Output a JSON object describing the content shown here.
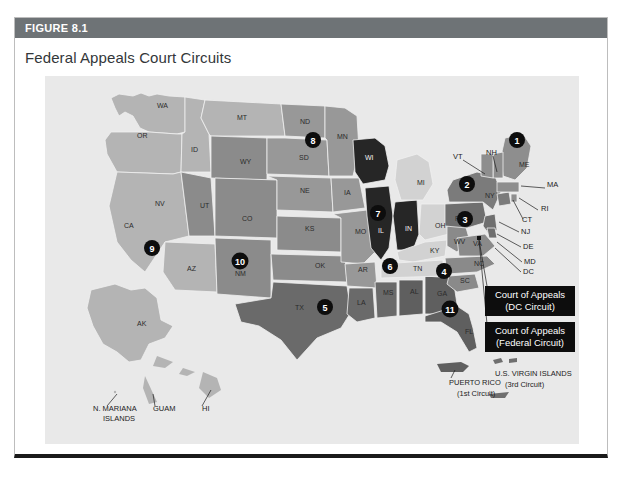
{
  "figure": {
    "label": "FIGURE 8.1",
    "title": "Federal Appeals Court Circuits"
  },
  "colors": {
    "header_bar": "#6e7376",
    "map_background": "#e9e9e9",
    "badge": "#0d0d0d",
    "callout_bg": "#0d0d0d",
    "circuit_1": "#8e8e8e",
    "circuit_2": "#7b7b7b",
    "circuit_3": "#6f6f6f",
    "circuit_4": "#8a8a8a",
    "circuit_5": "#6a6a6a",
    "circuit_6": "#d2d2d2",
    "circuit_7": "#262626",
    "circuit_8": "#989898",
    "circuit_9": "#b4b4b4",
    "circuit_10": "#8b8b8b",
    "circuit_11": "#5f5f5f"
  },
  "map": {
    "state_labels": [
      {
        "text": "WA",
        "x": 112,
        "y": 32
      },
      {
        "text": "OR",
        "x": 92,
        "y": 62
      },
      {
        "text": "ID",
        "x": 146,
        "y": 76
      },
      {
        "text": "MT",
        "x": 192,
        "y": 44
      },
      {
        "text": "ND",
        "x": 255,
        "y": 48
      },
      {
        "text": "SD",
        "x": 254,
        "y": 84
      },
      {
        "text": "NE",
        "x": 255,
        "y": 117
      },
      {
        "text": "KS",
        "x": 260,
        "y": 155
      },
      {
        "text": "OK",
        "x": 270,
        "y": 192
      },
      {
        "text": "TX",
        "x": 250,
        "y": 234
      },
      {
        "text": "WY",
        "x": 195,
        "y": 88
      },
      {
        "text": "UT",
        "x": 155,
        "y": 132
      },
      {
        "text": "CO",
        "x": 197,
        "y": 145
      },
      {
        "text": "NM",
        "x": 190,
        "y": 200
      },
      {
        "text": "AZ",
        "x": 142,
        "y": 195
      },
      {
        "text": "NV",
        "x": 110,
        "y": 130
      },
      {
        "text": "CA",
        "x": 79,
        "y": 152
      },
      {
        "text": "MN",
        "x": 292,
        "y": 63
      },
      {
        "text": "IA",
        "x": 299,
        "y": 119
      },
      {
        "text": "MO",
        "x": 310,
        "y": 158
      },
      {
        "text": "AR",
        "x": 313,
        "y": 196
      },
      {
        "text": "LA",
        "x": 312,
        "y": 229
      },
      {
        "text": "MS",
        "x": 338,
        "y": 219
      },
      {
        "text": "AL",
        "x": 365,
        "y": 218
      },
      {
        "text": "GA",
        "x": 392,
        "y": 220
      },
      {
        "text": "FL",
        "x": 420,
        "y": 258
      },
      {
        "text": "WI",
        "x": 320,
        "y": 84,
        "light": true
      },
      {
        "text": "IL",
        "x": 333,
        "y": 157,
        "light": true
      },
      {
        "text": "IN",
        "x": 360,
        "y": 155,
        "light": true
      },
      {
        "text": "MI",
        "x": 372,
        "y": 109
      },
      {
        "text": "OH",
        "x": 390,
        "y": 152
      },
      {
        "text": "KY",
        "x": 385,
        "y": 177
      },
      {
        "text": "TN",
        "x": 368,
        "y": 195
      },
      {
        "text": "WV",
        "x": 409,
        "y": 168
      },
      {
        "text": "VA",
        "x": 428,
        "y": 170
      },
      {
        "text": "NC",
        "x": 429,
        "y": 190
      },
      {
        "text": "SC",
        "x": 415,
        "y": 207
      },
      {
        "text": "PA",
        "x": 410,
        "y": 145
      },
      {
        "text": "NY",
        "x": 440,
        "y": 122
      },
      {
        "text": "ME",
        "x": 474,
        "y": 91
      }
    ],
    "leader_labels": [
      {
        "text": "VT",
        "x": 408,
        "y": 83
      },
      {
        "text": "NH",
        "x": 441,
        "y": 79
      },
      {
        "text": "MA",
        "x": 502,
        "y": 111
      },
      {
        "text": "RI",
        "x": 496,
        "y": 135
      },
      {
        "text": "CT",
        "x": 477,
        "y": 146
      },
      {
        "text": "NJ",
        "x": 476,
        "y": 158
      },
      {
        "text": "DE",
        "x": 478,
        "y": 173
      },
      {
        "text": "MD",
        "x": 479,
        "y": 188
      },
      {
        "text": "DC",
        "x": 478,
        "y": 198
      }
    ],
    "territory_labels": [
      {
        "text": "AK",
        "x": 92,
        "y": 250
      },
      {
        "text": "N. MARIANA",
        "x": 48,
        "y": 335
      },
      {
        "text": "ISLANDS",
        "x": 58,
        "y": 345
      },
      {
        "text": "GUAM",
        "x": 108,
        "y": 335
      },
      {
        "text": "HI",
        "x": 157,
        "y": 335
      },
      {
        "text": "PUERTO RICO",
        "x": 404,
        "y": 309
      },
      {
        "text": "(1st Circuit)",
        "x": 412,
        "y": 320
      },
      {
        "text": "U.S. VIRGIN ISLANDS",
        "x": 450,
        "y": 300
      },
      {
        "text": "(3rd Circuit)",
        "x": 460,
        "y": 311
      }
    ],
    "circuit_badges": [
      {
        "number": "1",
        "x": 472,
        "y": 64
      },
      {
        "number": "2",
        "x": 422,
        "y": 108
      },
      {
        "number": "3",
        "x": 420,
        "y": 143
      },
      {
        "number": "4",
        "x": 399,
        "y": 195
      },
      {
        "number": "5",
        "x": 280,
        "y": 231
      },
      {
        "number": "6",
        "x": 345,
        "y": 190
      },
      {
        "number": "7",
        "x": 333,
        "y": 137
      },
      {
        "number": "8",
        "x": 268,
        "y": 64
      },
      {
        "number": "9",
        "x": 107,
        "y": 172
      },
      {
        "number": "10",
        "x": 195,
        "y": 185
      },
      {
        "number": "11",
        "x": 405,
        "y": 233
      }
    ],
    "callouts": [
      {
        "line1": "Court of Appeals",
        "line2": "(DC Circuit)",
        "x": 440,
        "y": 210,
        "w": 90,
        "h": 30
      },
      {
        "line1": "Court of Appeals",
        "line2": "(Federal Circuit)",
        "x": 440,
        "y": 246,
        "w": 90,
        "h": 30
      }
    ]
  }
}
